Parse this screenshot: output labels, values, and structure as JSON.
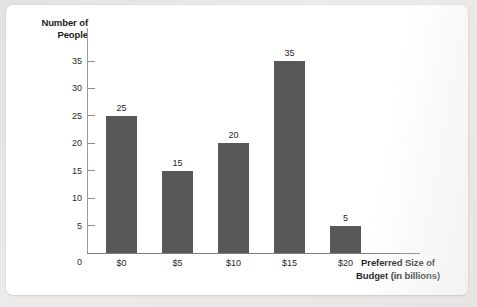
{
  "chart_data": {
    "type": "bar",
    "title": "",
    "subtitle": "",
    "xlabel": "Preferred Size of\nBudget (in billions)",
    "ylabel": "Number of\nPeople",
    "categories": [
      "$0",
      "$5",
      "$10",
      "$15",
      "$20"
    ],
    "values": [
      25,
      15,
      20,
      35,
      5
    ],
    "data_labels": [
      "25",
      "15",
      "20",
      "35",
      "5"
    ],
    "ylim": [
      0,
      35
    ],
    "yticks": [
      "35",
      "30",
      "25",
      "20",
      "15",
      "10",
      "5"
    ],
    "y_zero_label": "0",
    "grid": false,
    "legend": false,
    "legend_position": "none",
    "bar_color": "#585858",
    "axis_color": "#8d8d8b",
    "text_color": "#1f1f1f",
    "background_color": "#ffffff"
  }
}
